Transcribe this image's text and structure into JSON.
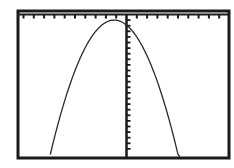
{
  "screen": {
    "description": "Graphing calculator window showing a downward-opening parabola",
    "frame_color": "#1a1a1a",
    "background": "#ffffff",
    "curve_color": "#2a2a2a"
  },
  "chart_data": {
    "type": "line",
    "title": "",
    "xlabel": "",
    "ylabel": "",
    "grid": false,
    "legend": "none",
    "axes": {
      "x_axis_position": "top edge of window",
      "y_axis_position": "slightly right of center",
      "x_ticks_left_of_origin": 10,
      "x_ticks_right_of_origin": 10,
      "y_ticks_below_origin": 24
    },
    "xlim": [
      -10,
      10
    ],
    "ylim": [
      -25,
      0
    ],
    "series": [
      {
        "name": "parabola",
        "shape": "downward parabola",
        "vertex": [
          -1.2,
          -1
        ],
        "x": [
          -7.4,
          -6,
          -4,
          -2,
          -1.2,
          0,
          2,
          4,
          5.2
        ],
        "y": [
          -25,
          -18.4,
          -8.8,
          -1.6,
          -1,
          -1.9,
          -12.4,
          -28.8,
          -25
        ]
      }
    ]
  }
}
